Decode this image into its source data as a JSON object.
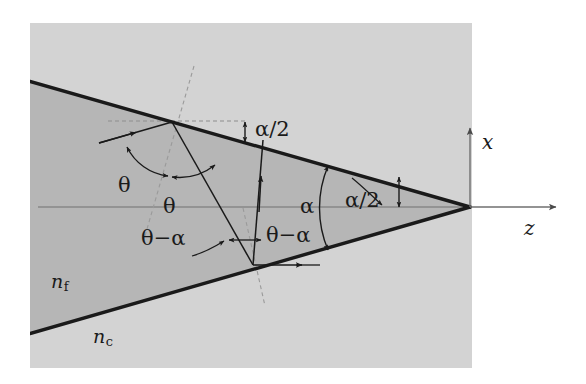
{
  "figure": {
    "kind": "optical-taper-ray-diagram",
    "panel": {
      "background_color": "#d3d3d3",
      "film_color": "#b6b6b6",
      "x": 30,
      "y": 23,
      "width": 442,
      "height": 345
    },
    "stroke_color": "#1a1a1a",
    "axis_color": "#6f6f6f",
    "dashed_color": "#8a8a8a"
  },
  "geometry": {
    "tip": {
      "x": 470,
      "y": 207
    },
    "upper_edge": {
      "x1": 32,
      "y1": 82,
      "x2": 470,
      "y2": 207
    },
    "lower_edge": {
      "x1": 32,
      "y1": 333,
      "x2": 470,
      "y2": 207
    },
    "upper_reflection_point": {
      "x": 172,
      "y": 122
    },
    "lower_reflection_point": {
      "x": 253,
      "y": 265
    },
    "axis_origin": {
      "x": 470,
      "y": 207
    }
  },
  "labels": {
    "theta_incident": "θ",
    "theta_reflected": "θ",
    "alpha": "α",
    "alpha_half_top": "α/2",
    "alpha_half_right": "α/2",
    "theta_minus_alpha_left": "θ−α",
    "theta_minus_alpha_right": "θ−α",
    "axis_x": "x",
    "axis_z": "z",
    "index_film": "n",
    "index_film_sub": "f",
    "index_cladding": "n",
    "index_cladding_sub": "c"
  },
  "angles": {
    "alpha_full_label": "α",
    "alpha_half_label": "α/2",
    "theta_label": "θ",
    "theta_minus_alpha_label": "θ−α"
  }
}
